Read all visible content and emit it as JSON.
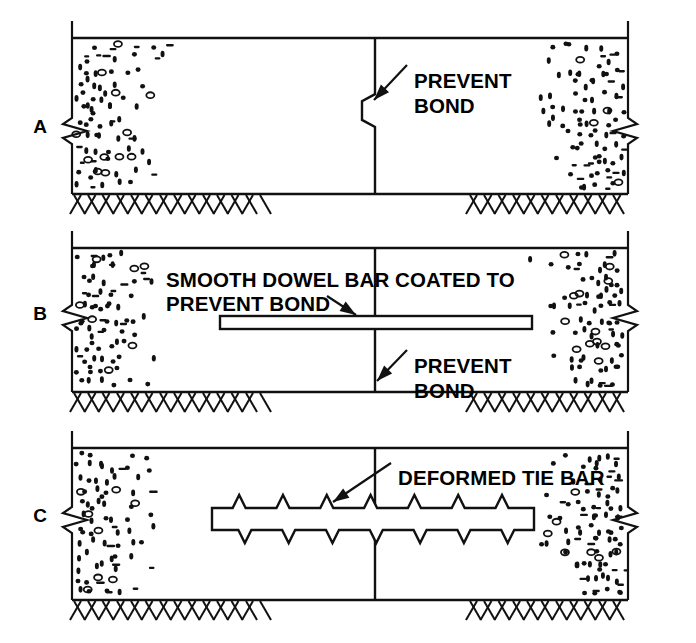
{
  "figure": {
    "background_color": "#ffffff",
    "line_color": "#111111"
  },
  "panels": [
    {
      "letter": "A",
      "name": "keyed-joint-panel",
      "label_x": 40,
      "label_y": 133,
      "frame": {
        "x": 72,
        "y": 38,
        "w": 556,
        "h": 156
      },
      "joint_x": 375,
      "joint_type": "keyway",
      "callouts": [
        {
          "name": "prevent-bond-callout",
          "lines": [
            "PREVENT",
            "BOND"
          ],
          "text_x": 414,
          "text_y": 73,
          "line_height": 25,
          "leader": {
            "x1": 407,
            "y1": 65,
            "x2": 374,
            "y2": 100
          }
        }
      ],
      "bar": null
    },
    {
      "letter": "B",
      "name": "doweled-joint-panel",
      "label_x": 40,
      "label_y": 320,
      "frame": {
        "x": 72,
        "y": 248,
        "w": 556,
        "h": 144
      },
      "joint_x": 375,
      "joint_type": "straight",
      "callouts": [
        {
          "name": "smooth-dowel-bar-callout",
          "lines": [
            "SMOOTH DOWEL BAR COATED TO",
            "PREVENT BOND"
          ],
          "text_x": 166,
          "text_y": 272,
          "line_height": 24,
          "leader": {
            "x1": 327,
            "y1": 296,
            "x2": 356,
            "y2": 315
          }
        },
        {
          "name": "prevent-bond-callout",
          "lines": [
            "PREVENT",
            "BOND"
          ],
          "text_x": 414,
          "text_y": 358,
          "line_height": 25,
          "leader": {
            "x1": 407,
            "y1": 350,
            "x2": 377,
            "y2": 381
          }
        }
      ],
      "bar": {
        "name": "smooth-dowel-bar",
        "type": "smooth",
        "x": 220,
        "y": 316,
        "w": 312,
        "h": 13
      }
    },
    {
      "letter": "C",
      "name": "tied-joint-panel",
      "label_x": 40,
      "label_y": 522,
      "frame": {
        "x": 72,
        "y": 448,
        "w": 556,
        "h": 152
      },
      "joint_x": 375,
      "joint_type": "straight",
      "callouts": [
        {
          "name": "deformed-tie-bar-callout",
          "lines": [
            "DEFORMED TIE BAR"
          ],
          "text_x": 398,
          "text_y": 470,
          "line_height": 24,
          "leader": {
            "x1": 391,
            "y1": 463,
            "x2": 333,
            "y2": 502
          }
        }
      ],
      "bar": {
        "name": "deformed-tie-bar",
        "type": "deformed",
        "x": 212,
        "y": 508,
        "w": 322,
        "h": 22,
        "teeth_top": 7,
        "teeth_bottom": 7
      }
    }
  ],
  "aggregate": {
    "name": "concrete-aggregate-texture",
    "description": "speckled concrete fill"
  },
  "subgrade": {
    "name": "subgrade-hatching",
    "description": "alternating slash hatch beneath slab"
  }
}
